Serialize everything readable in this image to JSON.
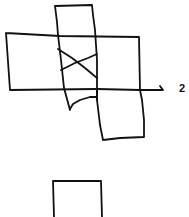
{
  "diagram": {
    "ink_color": "#111111",
    "background_color": "#ffffff",
    "labels": {
      "axis_label": "2"
    },
    "shapes": [
      {
        "id": "top-vertical-rectangle",
        "kind": "rectangle"
      },
      {
        "id": "wide-horizontal-rectangle",
        "kind": "rectangle"
      },
      {
        "id": "cross-mark",
        "kind": "x"
      },
      {
        "id": "curve-stroke",
        "kind": "curve"
      },
      {
        "id": "lower-right-rectangle",
        "kind": "rectangle"
      },
      {
        "id": "axis-arrow",
        "kind": "arrow"
      },
      {
        "id": "bottom-rectangle",
        "kind": "rectangle"
      }
    ]
  }
}
